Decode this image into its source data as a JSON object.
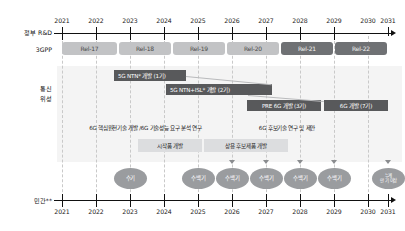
{
  "figure": {
    "type": "timeline-roadmap",
    "language": "ko"
  },
  "axes": {
    "top": {
      "name": "정부 R&D",
      "years": [
        "2021",
        "2022",
        "2023",
        "2024",
        "2025",
        "2026",
        "2027",
        "2028",
        "2029",
        "2030",
        "2031"
      ]
    },
    "bottom": {
      "name": "민간**",
      "years": [
        "2021",
        "2022",
        "2023",
        "2024",
        "2025",
        "2026",
        "2027",
        "2028",
        "2029",
        "2030",
        "2031"
      ]
    }
  },
  "rows": {
    "gpp": {
      "label": "3GPP",
      "releases": [
        {
          "label": "Rel-17",
          "tone": "light"
        },
        {
          "label": "Rel-18",
          "tone": "light"
        },
        {
          "label": "Rel-19",
          "tone": "light"
        },
        {
          "label": "Rel-20",
          "tone": "light"
        },
        {
          "label": "Rel-21",
          "tone": "dark"
        },
        {
          "label": "Rel-22",
          "tone": "dark"
        }
      ]
    },
    "satellite": {
      "label_line1": "통신",
      "label_line2": "위성",
      "bars": [
        {
          "label": "5G NTN* 개발 (1기)",
          "tone": "dark"
        },
        {
          "label": "5G NTN+ISL* 개발 (2기)",
          "tone": "dark"
        },
        {
          "label": "PRE 6G 개발 (3기)",
          "tone": "dark"
        },
        {
          "label": "6G 개발 (7기)",
          "tone": "dark"
        }
      ]
    },
    "research": {
      "bars": [
        {
          "label": "6G 핵심원천기술 개발 /6G 기술성능 요구 분석 연구",
          "tone": "plain"
        },
        {
          "label": "6G 후보기술 연구 및 제안",
          "tone": "plain"
        }
      ]
    },
    "product": {
      "bars": [
        {
          "label": "시작품 개발",
          "tone": "light"
        },
        {
          "label": "상용 후보제품 개발",
          "tone": "light"
        }
      ]
    },
    "private": {
      "ovals": [
        {
          "label": "수기",
          "year": "2023",
          "tone": "mid",
          "arrow": false
        },
        {
          "label": "수백기",
          "year": "2025",
          "tone": "mid",
          "arrow": false
        },
        {
          "label": "수백기",
          "year": "2026",
          "tone": "mid",
          "arrow": true
        },
        {
          "label": "수백기",
          "year": "2027",
          "tone": "mid",
          "arrow": true
        },
        {
          "label": "수백기",
          "year": "2028",
          "tone": "mid",
          "arrow": true
        },
        {
          "label": "수백기",
          "year": "2029",
          "tone": "mid",
          "arrow": true
        },
        {
          "label": "누계\n만기 이상",
          "year": "2031",
          "tone": "mid",
          "arrow": true
        }
      ]
    }
  },
  "annotations": {
    "launch_note_line1": "누계",
    "launch_note_line2": "만 기 이상"
  },
  "colors": {
    "bar_dark": "#58595b",
    "pill_light": "#c2c3c5",
    "pill_dark": "#6f7174",
    "bar_light": "#dcdddf",
    "oval": "#9a9c9f",
    "axis": "#111111",
    "guide": "#c9c9c9",
    "band": "#f4f4f4"
  }
}
